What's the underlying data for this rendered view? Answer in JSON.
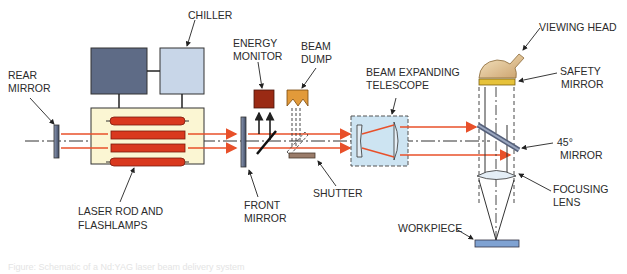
{
  "diagram": {
    "labels": {
      "chiller": "CHILLER",
      "rear_mirror_1": "REAR",
      "rear_mirror_2": "MIRROR",
      "laser_rod_1": "LASER ROD AND",
      "laser_rod_2": "FLASHLAMPS",
      "energy_monitor_1": "ENERGY",
      "energy_monitor_2": "MONITOR",
      "beam_dump_1": "BEAM",
      "beam_dump_2": "DUMP",
      "front_mirror_1": "FRONT",
      "front_mirror_2": "MIRROR",
      "shutter": "SHUTTER",
      "telescope_1": "BEAM EXPANDING",
      "telescope_2": "TELESCOPE",
      "viewing_head": "VIEWING HEAD",
      "safety_mirror_1": "SAFETY",
      "safety_mirror_2": "MIRROR",
      "mirror45_1": "45°",
      "mirror45_2": "MIRROR",
      "focusing_lens_1": "FOCUSING",
      "focusing_lens_2": "LENS",
      "workpiece": "WORKPIECE"
    },
    "colors": {
      "laser_beam": "#e8502a",
      "flashlamp": "#d9381e",
      "laser_head_bg": "#fbf6d3",
      "power_supply": "#5e6b86",
      "chiller": "#c8d6e8",
      "energy_monitor": "#9a2a14",
      "beam_dump": "#e29a3a",
      "shutter": "#9a7c6a",
      "telescope_bg": "#cde4f2",
      "safety_mirror": "#e6c23a",
      "viewing_head": "#e9cf9e",
      "workpiece": "#7fa2d2",
      "mirror": "#55607a"
    },
    "caption": "Figure: Schematic of a Nd:YAG laser beam delivery system"
  }
}
